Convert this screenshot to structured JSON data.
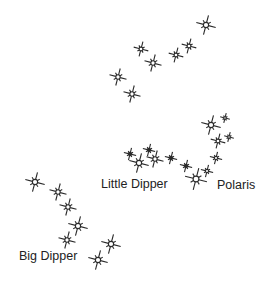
{
  "diagram": {
    "colors": {
      "star": "#2a2a2a",
      "text": "#222222",
      "background": "#ffffff"
    },
    "labels": [
      {
        "id": "little-dipper",
        "text": "Little Dipper",
        "x": 101,
        "y": 178
      },
      {
        "id": "polaris",
        "text": "Polaris",
        "x": 217,
        "y": 179
      },
      {
        "id": "big-dipper",
        "text": "Big Dipper",
        "x": 19,
        "y": 250
      }
    ],
    "star_groups": [
      {
        "name": "top-cluster",
        "stars": [
          {
            "x": 206,
            "y": 25,
            "r": 8
          },
          {
            "x": 189,
            "y": 46,
            "r": 6
          },
          {
            "x": 176,
            "y": 55,
            "r": 6
          },
          {
            "x": 153,
            "y": 63,
            "r": 7
          },
          {
            "x": 141,
            "y": 49,
            "r": 6
          },
          {
            "x": 118,
            "y": 77,
            "r": 7
          },
          {
            "x": 132,
            "y": 94,
            "r": 7
          }
        ]
      },
      {
        "name": "little-dipper",
        "stars": [
          {
            "x": 130,
            "y": 154,
            "r": 5,
            "solid": true
          },
          {
            "x": 149,
            "y": 150,
            "r": 5,
            "solid": true
          },
          {
            "x": 139,
            "y": 163,
            "r": 8
          },
          {
            "x": 155,
            "y": 159,
            "r": 7
          },
          {
            "x": 171,
            "y": 158,
            "r": 5,
            "solid": true
          },
          {
            "x": 186,
            "y": 166,
            "r": 5,
            "solid": true
          },
          {
            "x": 207,
            "y": 171,
            "r": 5
          },
          {
            "x": 196,
            "y": 179,
            "r": 9
          }
        ]
      },
      {
        "name": "polaris-arc",
        "stars": [
          {
            "x": 211,
            "y": 125,
            "r": 8
          },
          {
            "x": 225,
            "y": 118,
            "r": 4
          },
          {
            "x": 218,
            "y": 141,
            "r": 6
          },
          {
            "x": 229,
            "y": 137,
            "r": 4
          },
          {
            "x": 216,
            "y": 158,
            "r": 5
          }
        ]
      },
      {
        "name": "big-dipper",
        "stars": [
          {
            "x": 35,
            "y": 182,
            "r": 8
          },
          {
            "x": 58,
            "y": 192,
            "r": 7
          },
          {
            "x": 68,
            "y": 207,
            "r": 7
          },
          {
            "x": 78,
            "y": 226,
            "r": 8
          },
          {
            "x": 67,
            "y": 240,
            "r": 7
          },
          {
            "x": 111,
            "y": 244,
            "r": 8
          },
          {
            "x": 98,
            "y": 260,
            "r": 8
          }
        ]
      }
    ]
  }
}
